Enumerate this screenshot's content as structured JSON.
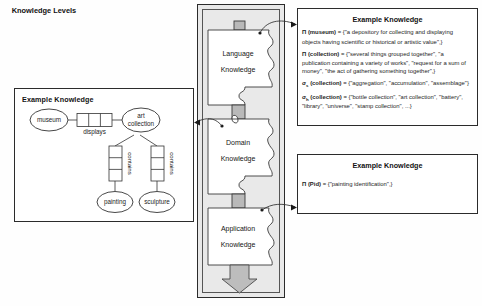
{
  "figure": {
    "left_panel": {
      "title": "Example Knowledge",
      "entities": [
        {
          "id": "museum",
          "label": "museum"
        },
        {
          "id": "art-collection",
          "label1": "art",
          "label2": "collection"
        },
        {
          "id": "painting",
          "label": "painting"
        },
        {
          "id": "sculpture",
          "label": "sculpture"
        }
      ],
      "relationships": [
        {
          "id": "displays",
          "label": "displays"
        },
        {
          "id": "contains-left",
          "label": "contains"
        },
        {
          "id": "contains-right",
          "label": "contains"
        }
      ]
    },
    "levels_panel": {
      "title": "Knowledge Levels",
      "pieces": [
        {
          "id": "language",
          "line1": "Language",
          "line2": "Knowledge"
        },
        {
          "id": "domain",
          "line1": "Domain",
          "line2": "Knowledge"
        },
        {
          "id": "application",
          "line1": "Application",
          "line2": "Knowledge"
        }
      ]
    },
    "top_right_panel": {
      "title": "Example Knowledge",
      "entries": [
        {
          "prefix": "Π",
          "sub": "",
          "term": "(museum)",
          "text": " = {\"a depository for collecting and displaying objects having scientific or historical or artistic value\",}"
        },
        {
          "prefix": "Π",
          "sub": "",
          "term": "(collection)",
          "text": " = {\"several things grouped together\", \"a publication containing a variety of works\", \"request for a sum of money\", \"the act of gathering something together\",}"
        },
        {
          "prefix": "σ",
          "sub": "s",
          "term": "(collection)",
          "text": " = {\"aggregation\", \"accumulation\", \"assemblage\"}"
        },
        {
          "prefix": "σ",
          "sub": "h",
          "term": "(collection)",
          "text": " = {\"bottle collection\", \"art collection\", \"battery\", \"library\", \"universe\", \"stamp collection\", ...}"
        }
      ]
    },
    "bottom_right_panel": {
      "title": "Example Knowledge",
      "entries": [
        {
          "prefix": "Π",
          "sub": "",
          "term": "(Pid)",
          "text": " = {\"painting identification\",}"
        }
      ]
    },
    "colors": {
      "panel_border": "#2b2b2b",
      "levels_background": "#e9e9e9",
      "puzzle_tab": "#b9b9b9",
      "arrow_fill": "#bdbdbd",
      "text": "#1a1a1a"
    }
  }
}
